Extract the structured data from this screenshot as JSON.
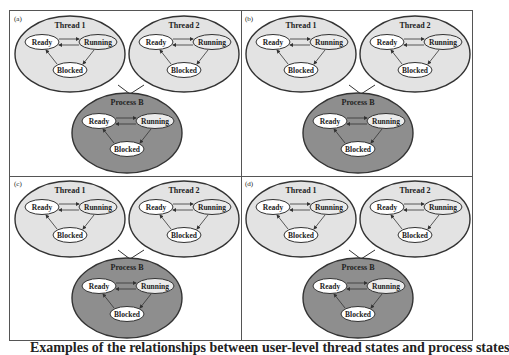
{
  "colors": {
    "thread_fill": "#e3e3e3",
    "process_fill": "#8e8e8e",
    "node_fill": "#ffffff",
    "running_fill": "#ebebeb",
    "stroke": "#333333"
  },
  "state_labels": {
    "ready": "Ready",
    "running": "Running",
    "blocked": "Blocked"
  },
  "panels": [
    {
      "label": "(a)",
      "thread1": "Thread 1",
      "thread2": "Thread 2",
      "process": "Process B"
    },
    {
      "label": "(b)",
      "thread1": "Thread 1",
      "thread2": "Thread 2",
      "process": "Process B"
    },
    {
      "label": "(c)",
      "thread1": "Thread 1",
      "thread2": "Thread 2",
      "process": "Process B"
    },
    {
      "label": "(d)",
      "thread1": "Thread 1",
      "thread2": "Thread 2",
      "process": "Process B"
    }
  ],
  "caption": "Examples of the relationships between user-level thread states and process states"
}
